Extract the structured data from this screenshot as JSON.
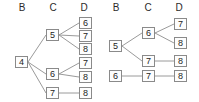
{
  "figure": {
    "background_color": "#ffffff",
    "node_border_color": "#8a8a8a",
    "node_fill_color": "#fdfdfd",
    "edge_color": "#9a9a9a",
    "text_color": "#242424"
  },
  "panels": [
    {
      "id": "left",
      "headers": [
        {
          "label": "B",
          "x": 15
        },
        {
          "label": "C",
          "x": 46
        },
        {
          "label": "D",
          "x": 77
        }
      ],
      "nodes": [
        {
          "id": "L-b4",
          "label": "4",
          "column": "B",
          "x": 15,
          "y": 56
        },
        {
          "id": "L-c5",
          "label": "5",
          "column": "C",
          "x": 46,
          "y": 29
        },
        {
          "id": "L-c6",
          "label": "6",
          "column": "C",
          "x": 46,
          "y": 68
        },
        {
          "id": "L-c7",
          "label": "7",
          "column": "C",
          "x": 46,
          "y": 87
        },
        {
          "id": "L-d6",
          "label": "6",
          "column": "D",
          "x": 79,
          "y": 17
        },
        {
          "id": "L-d7a",
          "label": "7",
          "column": "D",
          "x": 79,
          "y": 30
        },
        {
          "id": "L-d8a",
          "label": "8",
          "column": "D",
          "x": 79,
          "y": 43
        },
        {
          "id": "L-d7b",
          "label": "7",
          "column": "D",
          "x": 79,
          "y": 57
        },
        {
          "id": "L-d8b",
          "label": "8",
          "column": "D",
          "x": 79,
          "y": 71
        },
        {
          "id": "L-d8c",
          "label": "8",
          "column": "D",
          "x": 79,
          "y": 87
        }
      ],
      "edges": [
        {
          "from": "L-b4",
          "to": "L-c5"
        },
        {
          "from": "L-b4",
          "to": "L-c6"
        },
        {
          "from": "L-b4",
          "to": "L-c7"
        },
        {
          "from": "L-c5",
          "to": "L-d6"
        },
        {
          "from": "L-c5",
          "to": "L-d7a"
        },
        {
          "from": "L-c5",
          "to": "L-d8a"
        },
        {
          "from": "L-c6",
          "to": "L-d7b"
        },
        {
          "from": "L-c6",
          "to": "L-d8b"
        },
        {
          "from": "L-c7",
          "to": "L-d8c"
        }
      ]
    },
    {
      "id": "right",
      "headers": [
        {
          "label": "B",
          "x": 9
        },
        {
          "label": "C",
          "x": 41
        },
        {
          "label": "D",
          "x": 72
        }
      ],
      "nodes": [
        {
          "id": "R-b5",
          "label": "5",
          "column": "B",
          "x": 9,
          "y": 40
        },
        {
          "id": "R-b6",
          "label": "6",
          "column": "B",
          "x": 9,
          "y": 70
        },
        {
          "id": "R-c6",
          "label": "6",
          "column": "C",
          "x": 42,
          "y": 27
        },
        {
          "id": "R-c7a",
          "label": "7",
          "column": "C",
          "x": 42,
          "y": 55
        },
        {
          "id": "R-c7b",
          "label": "7",
          "column": "C",
          "x": 42,
          "y": 70
        },
        {
          "id": "R-d7",
          "label": "7",
          "column": "D",
          "x": 74,
          "y": 18
        },
        {
          "id": "R-d8a",
          "label": "8",
          "column": "D",
          "x": 74,
          "y": 37
        },
        {
          "id": "R-d8b",
          "label": "8",
          "column": "D",
          "x": 74,
          "y": 55
        },
        {
          "id": "R-d8c",
          "label": "8",
          "column": "D",
          "x": 74,
          "y": 70
        }
      ],
      "edges": [
        {
          "from": "R-b5",
          "to": "R-c6"
        },
        {
          "from": "R-b5",
          "to": "R-c7a"
        },
        {
          "from": "R-b6",
          "to": "R-c7b"
        },
        {
          "from": "R-c6",
          "to": "R-d7"
        },
        {
          "from": "R-c6",
          "to": "R-d8a"
        },
        {
          "from": "R-c7a",
          "to": "R-d8b"
        },
        {
          "from": "R-c7b",
          "to": "R-d8c"
        }
      ]
    }
  ]
}
